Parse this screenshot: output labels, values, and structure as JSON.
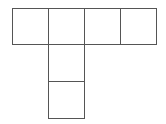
{
  "diagram": {
    "type": "cube-net",
    "line_color": "#555555",
    "background": "#ffffff",
    "cells": [
      {
        "id": "top-1",
        "row": 0,
        "col": 0,
        "x": 12,
        "y": 8,
        "w": 37,
        "h": 37
      },
      {
        "id": "top-2",
        "row": 0,
        "col": 1,
        "x": 48,
        "y": 8,
        "w": 37,
        "h": 37
      },
      {
        "id": "top-3",
        "row": 0,
        "col": 2,
        "x": 84,
        "y": 8,
        "w": 37,
        "h": 37
      },
      {
        "id": "top-4",
        "row": 0,
        "col": 3,
        "x": 120,
        "y": 8,
        "w": 37,
        "h": 37
      },
      {
        "id": "mid-2",
        "row": 1,
        "col": 1,
        "x": 48,
        "y": 44,
        "w": 37,
        "h": 38
      },
      {
        "id": "bot-2",
        "row": 2,
        "col": 1,
        "x": 48,
        "y": 81,
        "w": 37,
        "h": 38
      }
    ]
  }
}
